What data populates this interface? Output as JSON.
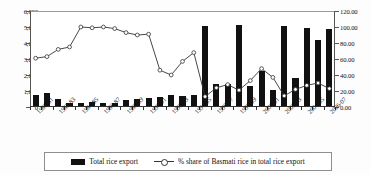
{
  "chart_data": {
    "type": "bar",
    "title": "",
    "subtitle": "",
    "xlabel": "",
    "ylabel": "",
    "y2label": "",
    "grid": false,
    "legend_position": "bottom",
    "ylim": [
      0,
      6000
    ],
    "ylim_right": [
      0,
      120
    ],
    "ytick_labels": [
      "0",
      "1,000",
      "2,000",
      "3,000",
      "4,000",
      "5,000",
      "6,000"
    ],
    "ytick_values": [
      0,
      1000,
      2000,
      3000,
      4000,
      5000,
      6000
    ],
    "ytick_labels_right": [
      "0.00",
      "20.00",
      "40.00",
      "60.00",
      "80.00",
      "100.00",
      "120.00"
    ],
    "ytick_values_right": [
      0,
      20,
      40,
      60,
      80,
      100,
      120
    ],
    "categories": [
      "1980-81",
      "1981-82",
      "1982-83",
      "1983-84",
      "1984-85",
      "1985-86",
      "1986-87",
      "1987-88",
      "1988-89",
      "1989-90",
      "1990-91",
      "1991-92",
      "1992-93",
      "1993-94",
      "1994-95",
      "1995-96",
      "1996-97",
      "1997-98",
      "1998-99",
      "1999-00",
      "2000-01",
      "2001-02",
      "2002-03",
      "2003-04",
      "2004-05",
      "2005-06",
      "2006-07"
    ],
    "visible_tick_labels": [
      "1980-81",
      "1982-83",
      "1984-85",
      "1986-87",
      "1988-89",
      "1990-91",
      "1992-93",
      "1994-95",
      "1996-97",
      "1998-99",
      "2000-01",
      "2002-03",
      "2004-05",
      "2006-07"
    ],
    "series": [
      {
        "name": "Total rice export",
        "type": "bar",
        "axis": "left",
        "color": "#111111",
        "values": [
          700,
          830,
          450,
          170,
          200,
          250,
          210,
          200,
          400,
          420,
          500,
          560,
          700,
          620,
          680,
          5000,
          1350,
          1400,
          5050,
          1250,
          2200,
          1000,
          5000,
          1750,
          4900,
          4150,
          4800
        ]
      },
      {
        "name": "% share of Basmati rice in total rice export",
        "type": "line",
        "axis": "right",
        "color": "#333333",
        "marker": "open-circle",
        "values": [
          61,
          63,
          72,
          75,
          100,
          99,
          100,
          98,
          93,
          90,
          91,
          46,
          40,
          57,
          68,
          13,
          24,
          28,
          21,
          33,
          48,
          37,
          14,
          22,
          27,
          30,
          23
        ]
      }
    ]
  },
  "legend": {
    "bar_label": "Total rice export",
    "line_label": "% share of Basmati rice in total rice export"
  }
}
